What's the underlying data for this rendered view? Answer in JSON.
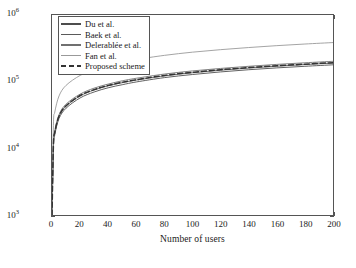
{
  "chart_data": {
    "type": "line",
    "title": "",
    "xlabel": "Number of users",
    "ylabel": "Size of the header",
    "xlim": [
      0,
      200
    ],
    "ylim": [
      1000,
      1000000
    ],
    "yscale": "log",
    "xscale": "linear",
    "grid": false,
    "legend_position": "upper left",
    "xticks": [
      "0",
      "20",
      "40",
      "60",
      "80",
      "100",
      "120",
      "140",
      "160",
      "180",
      "200"
    ],
    "xtick_values": [
      0,
      20,
      40,
      60,
      80,
      100,
      120,
      140,
      160,
      180,
      200
    ],
    "ytick_labels": [
      "10",
      "10",
      "10",
      "10"
    ],
    "ytick_exponents": [
      "3",
      "4",
      "5",
      "6"
    ],
    "ytick_values": [
      1000,
      10000,
      100000,
      1000000
    ],
    "x": [
      0,
      1,
      2,
      5,
      10,
      20,
      30,
      40,
      50,
      60,
      80,
      100,
      120,
      140,
      160,
      180,
      200
    ],
    "series": [
      {
        "name": "Du et al.",
        "color": "#4d4d4d",
        "style": "solid",
        "values": [
          1000,
          10000,
          16000,
          28000,
          40000,
          57000,
          70000,
          81000,
          90000,
          99000,
          115000,
          128000,
          140000,
          151000,
          161000,
          170000,
          179000
        ]
      },
      {
        "name": "Baek et al.",
        "color": "#5a5a5a",
        "style": "solid",
        "values": [
          1000,
          10800,
          17200,
          30000,
          43000,
          61000,
          75000,
          86500,
          96500,
          105500,
          122000,
          136000,
          148500,
          160000,
          170500,
          180500,
          190000
        ]
      },
      {
        "name": "Delerablee et al.",
        "color": "#707070",
        "style": "solid",
        "values": [
          1000,
          11500,
          18300,
          32000,
          46000,
          65000,
          80000,
          92000,
          103000,
          112500,
          130000,
          145000,
          158000,
          170000,
          181500,
          192000,
          202000
        ]
      },
      {
        "name": "Fan et al.",
        "color": "#999999",
        "style": "solid",
        "values": [
          1000,
          22000,
          35000,
          61000,
          88000,
          124000,
          152000,
          176000,
          196000,
          215000,
          248000,
          277000,
          302000,
          325000,
          347000,
          367000,
          386000
        ]
      },
      {
        "name": "Proposed scheme",
        "color": "#333333",
        "style": "dashed",
        "values": [
          1000,
          11000,
          17500,
          30500,
          43500,
          62000,
          76000,
          88000,
          98000,
          107000,
          124000,
          138000,
          151000,
          162500,
          173000,
          183000,
          193000
        ]
      }
    ]
  },
  "legend": {
    "items": [
      {
        "label": "Du et al."
      },
      {
        "label": "Baek et al."
      },
      {
        "label": "Delerablée et al."
      },
      {
        "label": "Fan et al."
      },
      {
        "label": "Proposed scheme"
      }
    ]
  },
  "axes": {
    "x_label": "Number of users",
    "y_label": "Size of the header"
  }
}
